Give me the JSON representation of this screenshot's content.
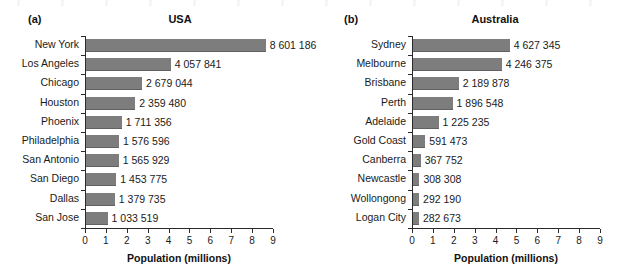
{
  "figure": {
    "background": "#ffffff",
    "bar_color": "#7d7d7d",
    "axis_color": "#2b2b2b",
    "text_color": "#1a1a1a"
  },
  "panels": [
    {
      "tag": "(a)",
      "title": "USA",
      "xlabel": "Population (millions)"
    },
    {
      "tag": "(b)",
      "title": "Australia",
      "xlabel": "Population (millions)"
    }
  ],
  "xticks": [
    "0",
    "1",
    "2",
    "3",
    "4",
    "5",
    "6",
    "7",
    "8",
    "9"
  ],
  "chart_data": [
    {
      "type": "bar",
      "orientation": "horizontal",
      "panel": "(a)",
      "title": "USA",
      "xlabel": "Population (millions)",
      "ylabel": "",
      "xlim": [
        0,
        9
      ],
      "grid": false,
      "legend": false,
      "xtick_values": [
        0,
        1,
        2,
        3,
        4,
        5,
        6,
        7,
        8,
        9
      ],
      "categories": [
        "New York",
        "Los Angeles",
        "Chicago",
        "Houston",
        "Phoenix",
        "Philadelphia",
        "San Antonio",
        "San Diego",
        "Dallas",
        "San Jose"
      ],
      "values": [
        8601186,
        4057841,
        2679044,
        2359480,
        1711356,
        1576596,
        1565929,
        1453775,
        1379735,
        1033519
      ],
      "values_millions": [
        8.601186,
        4.057841,
        2.679044,
        2.35948,
        1.711356,
        1.576596,
        1.565929,
        1.453775,
        1.379735,
        1.033519
      ],
      "data_labels": [
        "8 601 186",
        "4 057 841",
        "2 679 044",
        "2 359 480",
        "1 711 356",
        "1 576 596",
        "1 565 929",
        "1 453 775",
        "1 379 735",
        "1 033 519"
      ]
    },
    {
      "type": "bar",
      "orientation": "horizontal",
      "panel": "(b)",
      "title": "Australia",
      "xlabel": "Population (millions)",
      "ylabel": "",
      "xlim": [
        0,
        9
      ],
      "grid": false,
      "legend": false,
      "xtick_values": [
        0,
        1,
        2,
        3,
        4,
        5,
        6,
        7,
        8,
        9
      ],
      "categories": [
        "Sydney",
        "Melbourne",
        "Brisbane",
        "Perth",
        "Adelaide",
        "Gold Coast",
        "Canberra",
        "Newcastle",
        "Wollongong",
        "Logan City"
      ],
      "values": [
        4627345,
        4246375,
        2189878,
        1896548,
        1225235,
        591473,
        367752,
        308308,
        292190,
        282673
      ],
      "values_millions": [
        4.627345,
        4.246375,
        2.189878,
        1.896548,
        1.225235,
        0.591473,
        0.367752,
        0.308308,
        0.29219,
        0.282673
      ],
      "data_labels": [
        "4 627 345",
        "4 246 375",
        "2 189 878",
        "1 896 548",
        "1 225 235",
        "591 473",
        "367 752",
        "308 308",
        "292 190",
        "282 673"
      ]
    }
  ]
}
